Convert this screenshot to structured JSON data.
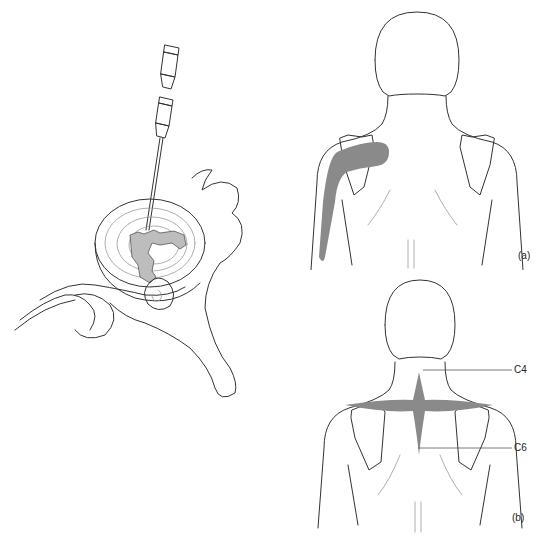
{
  "figure": {
    "left_panel": {
      "description": "Needle inserted into cervical intervertebral disc with disrupted nucleus, adjacent nerve root and vertebra",
      "colors": {
        "line": "#333333",
        "lesion_fill": "#bdbdbd"
      }
    },
    "panel_a": {
      "label": "(a)",
      "description": "Posterior view of upper body with referred pain band from scapula down the arm",
      "colors": {
        "line": "#333333",
        "pain_fill": "#8a8a8a"
      }
    },
    "panel_b": {
      "label": "(b)",
      "description": "Posterior view of upper body with referred pain across shoulders and upper back",
      "annotations": [
        {
          "text": "C4"
        },
        {
          "text": "C6"
        }
      ],
      "colors": {
        "line": "#333333",
        "pain_fill": "#8a8a8a",
        "leader_line": "#555555"
      }
    }
  }
}
